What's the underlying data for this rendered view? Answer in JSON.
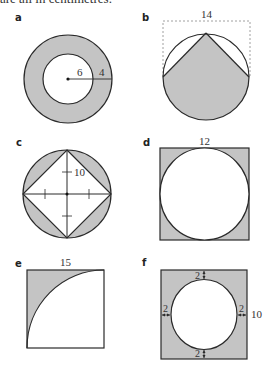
{
  "header": {
    "text": "are all in centimetres."
  },
  "figures": {
    "a": {
      "label": "a",
      "inner_radius": "6",
      "ring_width": "4"
    },
    "b": {
      "label": "b",
      "width": "14"
    },
    "c": {
      "label": "c",
      "dimension": "10"
    },
    "d": {
      "label": "d",
      "side": "12"
    },
    "e": {
      "label": "e",
      "side": "15"
    },
    "f": {
      "label": "f",
      "gap_top": "2",
      "gap_left": "2",
      "gap_right": "2",
      "gap_bottom": "2",
      "side": "10"
    }
  },
  "colors": {
    "shade": "#c4c4c4",
    "stroke": "#2a2a2a",
    "dashed": "#888888"
  }
}
